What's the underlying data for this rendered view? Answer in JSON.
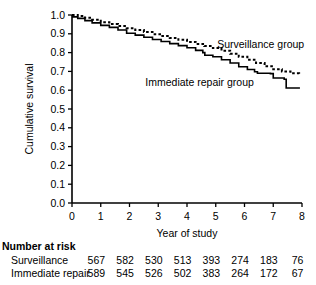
{
  "chart_data": {
    "type": "line",
    "title": "",
    "xlabel": "Year of study",
    "ylabel": "Cumulative survival",
    "xlim": [
      0,
      8
    ],
    "ylim": [
      0,
      1.0
    ],
    "xticks": [
      "0",
      "1",
      "2",
      "3",
      "4",
      "5",
      "6",
      "7",
      "8"
    ],
    "yticks": [
      "0.0",
      "0.1",
      "0.2",
      "0.3",
      "0.4",
      "0.5",
      "0.6",
      "0.7",
      "0.8",
      "0.9",
      "1.0"
    ],
    "grid": false,
    "legend_position": "inline-annotation",
    "series": [
      {
        "name": "Surveillance group",
        "style": "dotted",
        "color": "#000000",
        "label_x": 5.05,
        "label_y": 0.845,
        "x": [
          0,
          0.2,
          0.45,
          0.7,
          1.0,
          1.3,
          1.6,
          1.9,
          2.2,
          2.5,
          2.8,
          3.1,
          3.4,
          3.7,
          4.0,
          4.3,
          4.6,
          4.9,
          5.2,
          5.5,
          5.8,
          6.1,
          6.4,
          6.7,
          7.0,
          7.3,
          7.6,
          7.9
        ],
        "y": [
          1.0,
          0.995,
          0.985,
          0.975,
          0.962,
          0.952,
          0.941,
          0.93,
          0.92,
          0.909,
          0.898,
          0.888,
          0.878,
          0.868,
          0.857,
          0.846,
          0.835,
          0.824,
          0.81,
          0.794,
          0.778,
          0.762,
          0.745,
          0.727,
          0.712,
          0.7,
          0.69,
          0.684
        ]
      },
      {
        "name": "Immediate repair group",
        "style": "solid",
        "color": "#000000",
        "label_x": 2.55,
        "label_y": 0.642,
        "x": [
          0,
          0.2,
          0.45,
          0.7,
          1.0,
          1.3,
          1.6,
          1.9,
          2.2,
          2.5,
          2.8,
          3.1,
          3.4,
          3.7,
          4.0,
          4.3,
          4.55,
          4.62,
          4.9,
          5.2,
          5.5,
          5.8,
          6.1,
          6.35,
          6.45,
          6.9,
          7.0,
          7.38,
          7.45,
          7.9
        ],
        "y": [
          0.99,
          0.982,
          0.97,
          0.958,
          0.945,
          0.934,
          0.92,
          0.903,
          0.893,
          0.882,
          0.87,
          0.859,
          0.848,
          0.837,
          0.826,
          0.812,
          0.8,
          0.786,
          0.778,
          0.762,
          0.745,
          0.725,
          0.71,
          0.698,
          0.69,
          0.688,
          0.665,
          0.658,
          0.612,
          0.608
        ]
      }
    ]
  },
  "risk_table": {
    "heading": "Number at risk",
    "rows": [
      {
        "label": "Surveillance",
        "values": [
          "567",
          "582",
          "530",
          "513",
          "393",
          "274",
          "183",
          "76"
        ]
      },
      {
        "label": "Immediate repair",
        "values": [
          "589",
          "545",
          "526",
          "502",
          "383",
          "264",
          "172",
          "67"
        ]
      }
    ]
  }
}
